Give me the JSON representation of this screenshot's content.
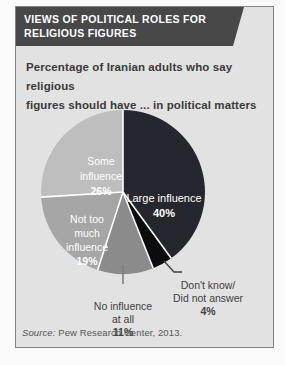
{
  "header": {
    "title_lines": [
      "VIEWS OF POLITICAL ROLES FOR",
      "RELIGIOUS FIGURES"
    ]
  },
  "subtitle_lines": [
    "Percentage of Iranian adults who say religious",
    "figures should have ... in political matters"
  ],
  "chart_data": {
    "type": "pie",
    "title": "Percentage of Iranian adults who say religious figures should have ... in political matters",
    "direction": "clockwise",
    "start_angle_deg": 0,
    "separator_color": "#ffffff",
    "slices": [
      {
        "label": "Large influence",
        "value": 40,
        "color": "#26262e"
      },
      {
        "label": "Don't know/Did not answer",
        "value": 4,
        "color": "#0c0c0e"
      },
      {
        "label": "No influence at all",
        "value": 11,
        "color": "#8b8b8b"
      },
      {
        "label": "Not too much influence",
        "value": 19,
        "color": "#a6a6a6"
      },
      {
        "label": "Some influence",
        "value": 26,
        "color": "#bebebe"
      }
    ]
  },
  "pie_labels": {
    "some": {
      "lines": [
        "Some",
        "influence"
      ],
      "pct": "26%"
    },
    "large": {
      "lines": [
        "Large influence"
      ],
      "pct": "40%"
    },
    "not_too_much": {
      "lines": [
        "Not too",
        "much",
        "influence"
      ],
      "pct": "19%"
    },
    "none": {
      "lines": [
        "No influence",
        "at all"
      ],
      "pct": "11%"
    },
    "dont_know": {
      "lines": [
        "Don't know/",
        "Did not answer"
      ],
      "pct": "4%"
    }
  },
  "source": {
    "prefix": "Source:",
    "text": " Pew Research Center, 2013."
  }
}
